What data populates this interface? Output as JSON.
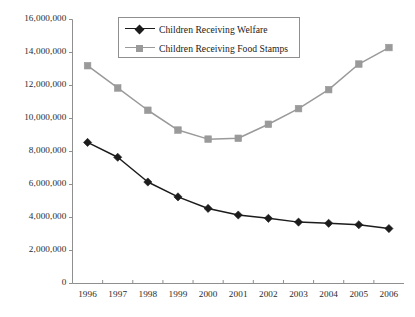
{
  "chart_data": {
    "type": "line",
    "title": "",
    "xlabel": "",
    "ylabel": "",
    "categories": [
      "1996",
      "1997",
      "1998",
      "1999",
      "2000",
      "2001",
      "2002",
      "2003",
      "2004",
      "2005",
      "2006"
    ],
    "series": [
      {
        "name": "Children Receiving Welfare",
        "color": "#1c1c1c",
        "marker": "diamond",
        "values": [
          8550000,
          7650000,
          6150000,
          5250000,
          4550000,
          4150000,
          3950000,
          3720000,
          3650000,
          3560000,
          3330000
        ]
      },
      {
        "name": "Children Receiving Food Stamps",
        "color": "#9a9a9a",
        "marker": "square",
        "values": [
          13200000,
          11850000,
          10500000,
          9300000,
          8750000,
          8800000,
          9650000,
          10600000,
          11750000,
          13300000,
          14300000
        ]
      }
    ],
    "ylim": [
      0,
      16000000
    ],
    "ytick_values": [
      0,
      2000000,
      4000000,
      6000000,
      8000000,
      10000000,
      12000000,
      14000000,
      16000000
    ],
    "ytick_labels": [
      "0",
      "2,000,000",
      "4,000,000",
      "6,000,000",
      "8,000,000",
      "10,000,000",
      "12,000,000",
      "14,000,000",
      "16,000,000"
    ],
    "grid": false,
    "legend_position": "top-center",
    "axis_color": "#8f8f8f"
  },
  "legend": {
    "entries": [
      {
        "label": "Children Receiving Welfare"
      },
      {
        "label": "Children Receiving Food Stamps"
      }
    ]
  }
}
